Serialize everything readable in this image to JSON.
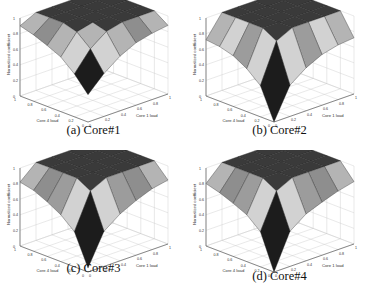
{
  "figure": {
    "panels": [
      {
        "id": "a",
        "caption": "(a)  Core#1",
        "x": 0,
        "y": 0,
        "caption_y": 131
      },
      {
        "id": "b",
        "caption": "(b)  Core#2",
        "x": 186,
        "y": 0,
        "caption_y": 131
      },
      {
        "id": "c",
        "caption": "(c)  Core#3",
        "x": 0,
        "y": 150,
        "caption_y": 119
      },
      {
        "id": "d",
        "caption": "(d)  Core#4",
        "x": 186,
        "y": 150,
        "caption_y": 127
      }
    ]
  },
  "chart_data": [
    {
      "type": "surface3d",
      "title": "(a) Core#1",
      "xlabel": "Core 1 load",
      "ylabel": "Core 4 load",
      "zlabel": "Normalized coefficient",
      "xticks": [
        0,
        0.2,
        0.4,
        0.6,
        0.8,
        1
      ],
      "yticks": [
        0,
        0.2,
        0.4,
        0.6,
        0.8,
        1
      ],
      "zticks": [
        0,
        0.2,
        0.4,
        0.6,
        0.8,
        1
      ],
      "zlim": [
        0,
        1
      ],
      "grid": true,
      "x": [
        0,
        0.2,
        0.4,
        0.6,
        0.8,
        1
      ],
      "y": [
        0,
        0.2,
        0.4,
        0.6,
        0.8,
        1
      ],
      "z": [
        [
          0.35,
          0.55,
          0.7,
          0.8,
          0.85,
          0.88
        ],
        [
          0.55,
          0.8,
          0.95,
          1,
          1,
          1
        ],
        [
          0.7,
          0.95,
          1,
          1,
          1,
          1
        ],
        [
          0.78,
          1,
          1,
          1,
          1,
          1
        ],
        [
          0.85,
          1,
          1,
          1,
          1,
          1
        ],
        [
          0.9,
          1,
          1,
          1,
          1,
          1
        ]
      ]
    },
    {
      "type": "surface3d",
      "title": "(b) Core#2",
      "xlabel": "Core 1 load",
      "ylabel": "Core 4 load",
      "zlabel": "Normalized coefficient",
      "xticks": [
        0,
        0.2,
        0.4,
        0.6,
        0.8,
        1
      ],
      "yticks": [
        0,
        0.2,
        0.4,
        0.6,
        0.8,
        1
      ],
      "zticks": [
        0,
        0.2,
        0.4,
        0.6,
        0.8,
        1
      ],
      "zlim": [
        0,
        1
      ],
      "grid": true,
      "x": [
        0,
        0.2,
        0.4,
        0.6,
        0.8,
        1
      ],
      "y": [
        0,
        0.2,
        0.4,
        0.6,
        0.8,
        1
      ],
      "z": [
        [
          0.0,
          0.4,
          0.55,
          0.65,
          0.7,
          0.72
        ],
        [
          0.4,
          0.9,
          1,
          1,
          1,
          1
        ],
        [
          0.55,
          1,
          1,
          1,
          1,
          1
        ],
        [
          0.65,
          1,
          1,
          1,
          1,
          1
        ],
        [
          0.7,
          1,
          1,
          1,
          1,
          1
        ],
        [
          0.72,
          1,
          1,
          1,
          1,
          1
        ]
      ]
    },
    {
      "type": "surface3d",
      "title": "(c) Core#3",
      "xlabel": "Core 1 load",
      "ylabel": "Core 4 load",
      "zlabel": "Normalized coefficient",
      "xticks": [
        0,
        0.2,
        0.4,
        0.6,
        0.8,
        1
      ],
      "yticks": [
        0,
        0.2,
        0.4,
        0.6,
        0.8,
        1
      ],
      "zticks": [
        0,
        0.2,
        0.4,
        0.6,
        0.8,
        1
      ],
      "zlim": [
        0,
        1
      ],
      "grid": true,
      "x": [
        0,
        0.2,
        0.4,
        0.6,
        0.8,
        1
      ],
      "y": [
        0,
        0.2,
        0.4,
        0.6,
        0.8,
        1
      ],
      "z": [
        [
          0.05,
          0.45,
          0.6,
          0.7,
          0.78,
          0.82
        ],
        [
          0.45,
          0.9,
          1,
          1,
          1,
          1
        ],
        [
          0.6,
          1,
          1,
          1,
          1,
          1
        ],
        [
          0.7,
          1,
          1,
          1,
          1,
          1
        ],
        [
          0.78,
          1,
          1,
          1,
          1,
          1
        ],
        [
          0.82,
          1,
          1,
          1,
          1,
          1
        ]
      ]
    },
    {
      "type": "surface3d",
      "title": "(d) Core#4",
      "xlabel": "Core 1 load",
      "ylabel": "Core 4 load",
      "zlabel": "Normalized coefficient",
      "xticks": [
        0,
        0.2,
        0.4,
        0.6,
        0.8,
        1
      ],
      "yticks": [
        0,
        0.2,
        0.4,
        0.6,
        0.8,
        1
      ],
      "zticks": [
        0,
        0.2,
        0.4,
        0.6,
        0.8,
        1
      ],
      "zlim": [
        0,
        1
      ],
      "grid": true,
      "x": [
        0,
        0.2,
        0.4,
        0.6,
        0.8,
        1
      ],
      "y": [
        0,
        0.2,
        0.4,
        0.6,
        0.8,
        1
      ],
      "z": [
        [
          0.0,
          0.45,
          0.6,
          0.68,
          0.75,
          0.8
        ],
        [
          0.45,
          0.9,
          1,
          1,
          1,
          1
        ],
        [
          0.6,
          1,
          1,
          1,
          1,
          1
        ],
        [
          0.68,
          1,
          1,
          1,
          1,
          1
        ],
        [
          0.75,
          1,
          1,
          1,
          1,
          1
        ],
        [
          0.8,
          1,
          1,
          1,
          1,
          1
        ]
      ]
    }
  ]
}
